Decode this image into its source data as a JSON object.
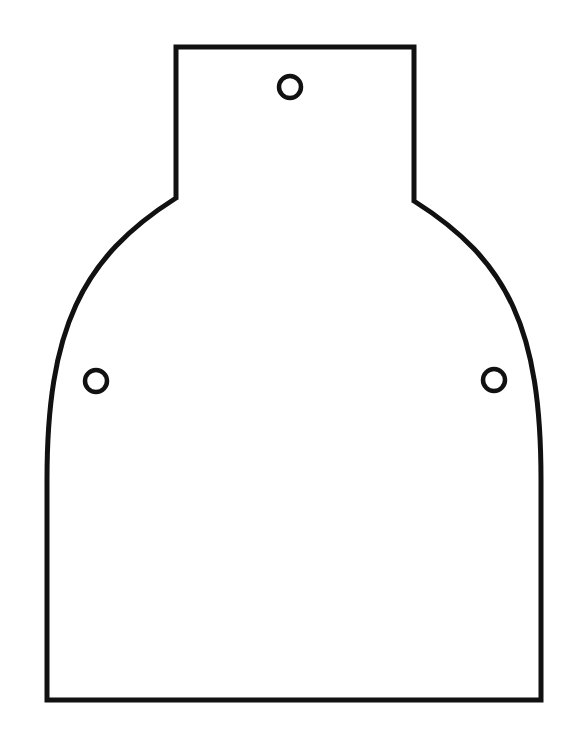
{
  "diagram": {
    "type": "template-outline",
    "stroke_color": "#111111",
    "fill_color": "#ffffff",
    "background": "#ffffff",
    "stroke_width": 5,
    "outline": {
      "neck": {
        "left": 176,
        "right": 414,
        "top": 47,
        "bottom_left": 198,
        "bottom_right": 201
      },
      "body": {
        "left": 47,
        "right": 541,
        "bottom": 700,
        "vertical_start_y": 480
      }
    },
    "holes": [
      {
        "name": "top-hole",
        "cx": 290,
        "cy": 87,
        "r": 11
      },
      {
        "name": "left-hole",
        "cx": 96,
        "cy": 381,
        "r": 11
      },
      {
        "name": "right-hole",
        "cx": 494,
        "cy": 380,
        "r": 11
      }
    ]
  }
}
